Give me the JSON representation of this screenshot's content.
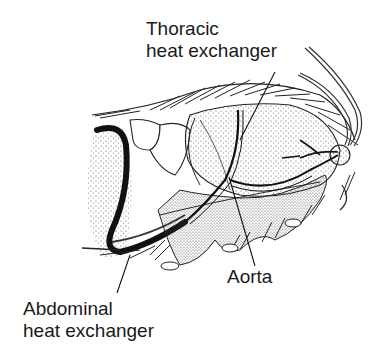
{
  "figure": {
    "labels": [
      {
        "id": "thoracic",
        "line1": "Thoracic",
        "line2": "heat exchanger"
      },
      {
        "id": "aorta",
        "line1": "Aorta"
      },
      {
        "id": "abdominal",
        "line1": "Abdominal",
        "line2": "heat exchanger"
      }
    ],
    "colors": {
      "ink": "#1a1a1a",
      "background": "#ffffff",
      "stipple": "#555555"
    }
  }
}
